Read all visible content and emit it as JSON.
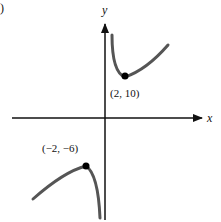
{
  "figure": {
    "panel_label": ")",
    "axes": {
      "x_label": "x",
      "y_label": "y"
    },
    "points": [
      {
        "label": "(2, 10)",
        "x": 2,
        "y": 10,
        "type": "local minimum"
      },
      {
        "label": "(−2, −6)",
        "x": -2,
        "y": -6,
        "type": "local maximum"
      }
    ],
    "colors": {
      "curve": "#555555",
      "axis": "#111111",
      "point": "#000000"
    }
  }
}
